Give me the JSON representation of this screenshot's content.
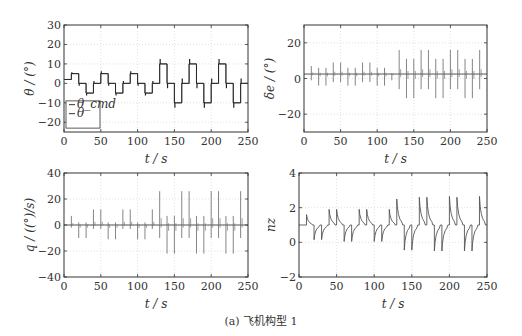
{
  "caption": "(a) 飞机构型 1",
  "chart_data": [
    {
      "type": "line",
      "id": "theta",
      "title": "",
      "xlabel": "t / s",
      "ylabel": "θ / (°)",
      "xlim": [
        0,
        250
      ],
      "ylim": [
        -25,
        30
      ],
      "xticks": [
        0,
        50,
        100,
        150,
        200,
        250
      ],
      "yticks": [
        -20,
        -10,
        0,
        10,
        20,
        30
      ],
      "ytick_labels": [
        "−20",
        "−10",
        "0",
        "10",
        "20",
        "30"
      ],
      "grid": true,
      "legend": {
        "position": "lower left",
        "entries": [
          "θ_cmd",
          "θ"
        ]
      },
      "box": [
        64,
        25,
        248,
        132
      ],
      "series": [
        {
          "name": "θ_cmd",
          "steps": [
            [
              0,
              2
            ],
            [
              10,
              5
            ],
            [
              20,
              0
            ],
            [
              30,
              -5
            ],
            [
              40,
              0
            ],
            [
              50,
              5
            ],
            [
              60,
              0
            ],
            [
              70,
              -5
            ],
            [
              80,
              0
            ],
            [
              90,
              5
            ],
            [
              100,
              0
            ],
            [
              110,
              -5
            ],
            [
              120,
              0
            ],
            [
              130,
              10
            ],
            [
              140,
              0
            ],
            [
              150,
              -10
            ],
            [
              160,
              0
            ],
            [
              170,
              10
            ],
            [
              180,
              0
            ],
            [
              190,
              -10
            ],
            [
              200,
              0
            ],
            [
              210,
              10
            ],
            [
              220,
              0
            ],
            [
              230,
              -10
            ],
            [
              240,
              0
            ],
            [
              250,
              0
            ]
          ]
        },
        {
          "name": "θ",
          "steps": [
            [
              0,
              2
            ],
            [
              10,
              5
            ],
            [
              20,
              0
            ],
            [
              30,
              -5
            ],
            [
              40,
              0
            ],
            [
              50,
              5
            ],
            [
              60,
              0
            ],
            [
              70,
              -5
            ],
            [
              80,
              0
            ],
            [
              90,
              5
            ],
            [
              100,
              0
            ],
            [
              110,
              -5
            ],
            [
              120,
              0
            ],
            [
              130,
              10
            ],
            [
              140,
              0
            ],
            [
              150,
              -10
            ],
            [
              160,
              0
            ],
            [
              170,
              10
            ],
            [
              180,
              0
            ],
            [
              190,
              -10
            ],
            [
              200,
              0
            ],
            [
              210,
              10
            ],
            [
              220,
              0
            ],
            [
              230,
              -10
            ],
            [
              240,
              0
            ],
            [
              250,
              0
            ]
          ]
        }
      ]
    },
    {
      "type": "line",
      "id": "delta_e",
      "xlabel": "t / s",
      "ylabel": "δe / (°)",
      "xlim": [
        0,
        250
      ],
      "ylim": [
        -30,
        30
      ],
      "xticks": [
        0,
        50,
        100,
        150,
        200,
        250
      ],
      "yticks": [
        -20,
        0,
        20
      ],
      "ytick_labels": [
        "−20",
        "0",
        "20"
      ],
      "grid": true,
      "box": [
        304,
        25,
        487,
        132
      ],
      "baseline": 2.5,
      "spikes": [
        [
          10,
          7,
          -1
        ],
        [
          20,
          6,
          -4
        ],
        [
          30,
          6,
          -4
        ],
        [
          40,
          9,
          -2
        ],
        [
          50,
          9,
          -2
        ],
        [
          60,
          6,
          -4
        ],
        [
          70,
          6,
          -4
        ],
        [
          80,
          9,
          -2
        ],
        [
          90,
          9,
          -2
        ],
        [
          100,
          6,
          -4
        ],
        [
          110,
          6,
          -4
        ],
        [
          120,
          3,
          -1
        ],
        [
          130,
          16,
          -6
        ],
        [
          140,
          11,
          -11
        ],
        [
          150,
          11,
          -11
        ],
        [
          160,
          16,
          -6
        ],
        [
          170,
          16,
          -6
        ],
        [
          180,
          11,
          -11
        ],
        [
          190,
          11,
          -11
        ],
        [
          200,
          16,
          -6
        ],
        [
          210,
          16,
          -6
        ],
        [
          220,
          11,
          -11
        ],
        [
          230,
          11,
          -11
        ],
        [
          240,
          16,
          -6
        ]
      ]
    },
    {
      "type": "line",
      "id": "q",
      "xlabel": "t / s",
      "ylabel": "q / ((°)/s)",
      "xlim": [
        0,
        250
      ],
      "ylim": [
        -40,
        40
      ],
      "xticks": [
        0,
        50,
        100,
        150,
        200,
        250
      ],
      "yticks": [
        -40,
        -20,
        0,
        20,
        40
      ],
      "ytick_labels": [
        "−40",
        "−20",
        "0",
        "20",
        "40"
      ],
      "grid": true,
      "box": [
        64,
        173,
        248,
        277
      ],
      "baseline": 0,
      "spikes": [
        [
          10,
          7,
          -2
        ],
        [
          20,
          2,
          -10
        ],
        [
          30,
          2,
          -10
        ],
        [
          40,
          12,
          -3
        ],
        [
          50,
          12,
          -3
        ],
        [
          60,
          2,
          -11
        ],
        [
          70,
          2,
          -11
        ],
        [
          80,
          12,
          -3
        ],
        [
          90,
          12,
          -3
        ],
        [
          100,
          2,
          -11
        ],
        [
          110,
          2,
          -11
        ],
        [
          120,
          12,
          -3
        ],
        [
          130,
          26,
          -10
        ],
        [
          140,
          7,
          -22
        ],
        [
          150,
          7,
          -22
        ],
        [
          160,
          26,
          -10
        ],
        [
          170,
          26,
          -10
        ],
        [
          180,
          7,
          -22
        ],
        [
          190,
          7,
          -22
        ],
        [
          200,
          26,
          -10
        ],
        [
          210,
          26,
          -10
        ],
        [
          220,
          7,
          -22
        ],
        [
          230,
          7,
          -22
        ],
        [
          240,
          26,
          -10
        ]
      ]
    },
    {
      "type": "line",
      "id": "nz",
      "xlabel": "t / s",
      "ylabel": "nz",
      "xlim": [
        0,
        250
      ],
      "ylim": [
        -2,
        4
      ],
      "xticks": [
        0,
        50,
        100,
        150,
        200,
        250
      ],
      "yticks": [
        -2,
        0,
        2,
        4
      ],
      "ytick_labels": [
        "−2",
        "0",
        "2",
        "4"
      ],
      "grid": true,
      "box": [
        299,
        173,
        487,
        277
      ],
      "baseline": 1,
      "pulses": [
        [
          10,
          1.6
        ],
        [
          20,
          0.15
        ],
        [
          30,
          0.15
        ],
        [
          40,
          1.9
        ],
        [
          50,
          1.9
        ],
        [
          60,
          0.05
        ],
        [
          70,
          0.05
        ],
        [
          80,
          1.9
        ],
        [
          90,
          1.9
        ],
        [
          100,
          0.05
        ],
        [
          110,
          0.05
        ],
        [
          120,
          1.9
        ],
        [
          130,
          2.5
        ],
        [
          140,
          -0.45
        ],
        [
          150,
          -0.45
        ],
        [
          160,
          2.6
        ],
        [
          170,
          2.6
        ],
        [
          180,
          -0.5
        ],
        [
          190,
          -0.5
        ],
        [
          200,
          2.65
        ],
        [
          210,
          2.6
        ],
        [
          220,
          -0.5
        ],
        [
          230,
          -0.5
        ],
        [
          240,
          2.65
        ]
      ]
    }
  ]
}
